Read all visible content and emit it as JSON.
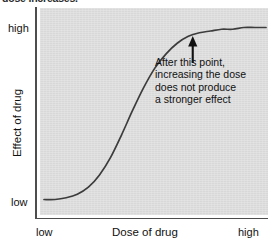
{
  "figure": {
    "caption_fragment": "dose increases.",
    "panel_color": "#dcdcdc",
    "axis_color": "#4d4d4d",
    "curve_color": "#3c3c3c"
  },
  "annotation": {
    "lines": [
      "After this point,",
      "increasing the dose",
      "does not produce",
      "a stronger effect"
    ],
    "arrow_label": "arrow-up-to-curve-knee"
  },
  "chart_data": {
    "type": "line",
    "title": "",
    "subtitle": "",
    "xlabel": "Dose of drug",
    "ylabel": "Effect of drug",
    "xlim": [
      0,
      1
    ],
    "ylim": [
      0,
      1
    ],
    "grid": false,
    "legend": null,
    "xtick_labels": [
      "low",
      "high"
    ],
    "ytick_labels": [
      "low",
      "high"
    ],
    "ytick_low_label": "low",
    "ytick_high_label": "high",
    "xtick_low_label": "low",
    "xtick_high_label": "high",
    "series": [
      {
        "name": "Dose-response curve",
        "shape": "sigmoid",
        "x": [
          0.0,
          0.05,
          0.1,
          0.15,
          0.2,
          0.25,
          0.3,
          0.35,
          0.4,
          0.45,
          0.5,
          0.55,
          0.6,
          0.65,
          0.7,
          0.75,
          0.8,
          0.85,
          0.9,
          0.95,
          1.0
        ],
        "y": [
          0.02,
          0.02,
          0.03,
          0.05,
          0.09,
          0.16,
          0.26,
          0.39,
          0.53,
          0.66,
          0.77,
          0.85,
          0.91,
          0.95,
          0.97,
          0.98,
          0.99,
          0.99,
          1.0,
          1.0,
          1.0
        ]
      }
    ],
    "annotations": [
      {
        "text": "After this point, increasing the dose does not produce a stronger effect",
        "arrow_tip_x": 0.67,
        "arrow_tip_y": 0.96,
        "arrow_direction": "up"
      }
    ]
  }
}
